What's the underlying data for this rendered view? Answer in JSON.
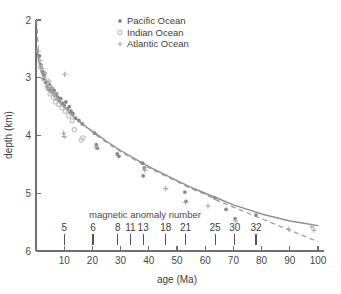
{
  "chart_data": {
    "type": "scatter",
    "title": "",
    "xlabel": "age (Ma)",
    "ylabel": "depth (km)",
    "inner_annotation": "magnetic anomaly number",
    "xlim": [
      0,
      100
    ],
    "ylim": [
      6,
      2
    ],
    "y_inverted": true,
    "grid": false,
    "legend_position": "top-center",
    "x_ticks": [
      10,
      20,
      30,
      40,
      50,
      60,
      70,
      80,
      90,
      100
    ],
    "x_tick_labels": [
      "10",
      "20",
      "30",
      "40",
      "50",
      "60",
      "70",
      "80",
      "90",
      "100"
    ],
    "y_ticks": [
      2,
      3,
      4,
      5,
      6
    ],
    "y_tick_labels": [
      "2",
      "3",
      "4",
      "5",
      "6"
    ],
    "magnetic_anomalies": [
      {
        "label": "5",
        "age": 10.0
      },
      {
        "label": "6",
        "age": 20.2
      },
      {
        "label": "8",
        "age": 29.0
      },
      {
        "label": "11",
        "age": 33.5
      },
      {
        "label": "13",
        "age": 38.0
      },
      {
        "label": "18",
        "age": 46.0
      },
      {
        "label": "21",
        "age": 53.0
      },
      {
        "label": "25",
        "age": 63.5
      },
      {
        "label": "30",
        "age": 70.5
      },
      {
        "label": "32",
        "age": 78.0
      }
    ],
    "series": [
      {
        "name": "Pacific Ocean",
        "marker": "filled-circle",
        "color": "#8a8a8a",
        "points": [
          [
            1.2,
            2.62
          ],
          [
            1.8,
            2.78
          ],
          [
            2.4,
            2.9
          ],
          [
            2.6,
            3.02
          ],
          [
            3.0,
            2.96
          ],
          [
            3.4,
            3.08
          ],
          [
            3.9,
            3.14
          ],
          [
            4.3,
            3.2
          ],
          [
            4.8,
            3.12
          ],
          [
            5.2,
            3.24
          ],
          [
            5.6,
            3.18
          ],
          [
            6.0,
            3.26
          ],
          [
            6.4,
            3.22
          ],
          [
            6.9,
            3.3
          ],
          [
            7.3,
            3.28
          ],
          [
            7.8,
            3.34
          ],
          [
            8.2,
            3.4
          ],
          [
            8.8,
            3.36
          ],
          [
            9.4,
            3.44
          ],
          [
            10.0,
            3.48
          ],
          [
            10.6,
            3.42
          ],
          [
            11.2,
            3.54
          ],
          [
            11.8,
            3.5
          ],
          [
            12.4,
            3.58
          ],
          [
            13.1,
            3.62
          ],
          [
            14.0,
            3.7
          ],
          [
            15.2,
            3.74
          ],
          [
            16.4,
            3.8
          ],
          [
            20.8,
            3.96
          ],
          [
            21.4,
            4.16
          ],
          [
            21.8,
            4.22
          ],
          [
            28.8,
            4.32
          ],
          [
            29.4,
            4.36
          ],
          [
            37.8,
            4.48
          ],
          [
            38.4,
            4.56
          ],
          [
            38.0,
            4.7
          ],
          [
            52.8,
            4.98
          ],
          [
            53.2,
            5.14
          ],
          [
            63.4,
            5.08
          ],
          [
            67.4,
            5.28
          ],
          [
            70.6,
            5.44
          ],
          [
            78.0,
            5.38
          ]
        ]
      },
      {
        "name": "Indian Ocean",
        "marker": "open-circle",
        "color": "#c0c0c0",
        "points": [
          [
            1.6,
            2.82
          ],
          [
            2.8,
            3.02
          ],
          [
            4.0,
            3.16
          ],
          [
            5.0,
            3.28
          ],
          [
            6.2,
            3.34
          ],
          [
            7.0,
            3.42
          ],
          [
            8.0,
            3.46
          ],
          [
            9.2,
            3.52
          ],
          [
            10.4,
            3.58
          ],
          [
            11.6,
            3.66
          ],
          [
            12.8,
            3.74
          ],
          [
            13.6,
            3.9
          ],
          [
            16.0,
            4.08
          ],
          [
            16.6,
            4.04
          ]
        ]
      },
      {
        "name": "Atlantic Ocean",
        "marker": "plus",
        "color": "#a8a8a8",
        "points": [
          [
            0.8,
            2.54
          ],
          [
            1.4,
            2.7
          ],
          [
            2.2,
            2.84
          ],
          [
            3.2,
            2.92
          ],
          [
            4.6,
            3.06
          ],
          [
            5.8,
            3.18
          ],
          [
            6.6,
            3.28
          ],
          [
            7.6,
            3.38
          ],
          [
            10.2,
            2.94
          ],
          [
            9.8,
            3.96
          ],
          [
            10.0,
            4.02
          ],
          [
            21.2,
            4.2
          ],
          [
            38.6,
            4.6
          ],
          [
            46.0,
            4.92
          ],
          [
            53.0,
            5.16
          ],
          [
            61.0,
            5.22
          ],
          [
            70.8,
            5.48
          ],
          [
            89.6,
            5.62
          ],
          [
            97.8,
            5.58
          ],
          [
            98.6,
            5.64
          ]
        ]
      }
    ],
    "curves": [
      {
        "name": "plate-model-curve",
        "style": "solid",
        "color": "#8f8f8f",
        "points": [
          [
            0.3,
            2.5
          ],
          [
            1.0,
            2.72
          ],
          [
            2.0,
            2.92
          ],
          [
            3.0,
            3.04
          ],
          [
            4.0,
            3.14
          ],
          [
            5.0,
            3.22
          ],
          [
            6.0,
            3.3
          ],
          [
            8.0,
            3.42
          ],
          [
            10.0,
            3.52
          ],
          [
            12.0,
            3.62
          ],
          [
            15.0,
            3.74
          ],
          [
            18.0,
            3.86
          ],
          [
            21.0,
            3.96
          ],
          [
            25.0,
            4.1
          ],
          [
            30.0,
            4.26
          ],
          [
            35.0,
            4.4
          ],
          [
            40.0,
            4.54
          ],
          [
            45.0,
            4.66
          ],
          [
            50.0,
            4.78
          ],
          [
            55.0,
            4.9
          ],
          [
            60.0,
            5.0
          ],
          [
            65.0,
            5.1
          ],
          [
            70.0,
            5.2
          ],
          [
            75.0,
            5.28
          ],
          [
            80.0,
            5.36
          ],
          [
            85.0,
            5.42
          ],
          [
            90.0,
            5.48
          ],
          [
            95.0,
            5.52
          ],
          [
            100.0,
            5.56
          ]
        ]
      },
      {
        "name": "sqrt-age-curve",
        "style": "dashed",
        "color": "#9a9a9a",
        "points": [
          [
            0.2,
            2.0
          ],
          [
            1.0,
            2.62
          ],
          [
            2.0,
            2.82
          ],
          [
            3.0,
            2.96
          ],
          [
            4.0,
            3.06
          ],
          [
            5.0,
            3.16
          ],
          [
            6.0,
            3.24
          ],
          [
            8.0,
            3.38
          ],
          [
            10.0,
            3.5
          ],
          [
            12.0,
            3.6
          ],
          [
            15.0,
            3.74
          ],
          [
            18.0,
            3.86
          ],
          [
            21.0,
            3.98
          ],
          [
            25.0,
            4.12
          ],
          [
            30.0,
            4.28
          ],
          [
            35.0,
            4.42
          ],
          [
            40.0,
            4.56
          ],
          [
            45.0,
            4.68
          ],
          [
            50.0,
            4.8
          ],
          [
            55.0,
            4.92
          ],
          [
            60.0,
            5.02
          ],
          [
            65.0,
            5.14
          ],
          [
            70.0,
            5.24
          ],
          [
            75.0,
            5.34
          ],
          [
            80.0,
            5.44
          ],
          [
            85.0,
            5.54
          ],
          [
            90.0,
            5.64
          ],
          [
            95.0,
            5.74
          ],
          [
            100.0,
            5.84
          ]
        ]
      }
    ],
    "legend": [
      {
        "label": "Pacific Ocean",
        "marker": "filled-circle"
      },
      {
        "label": "Indian Ocean",
        "marker": "open-circle"
      },
      {
        "label": "Atlantic Ocean",
        "marker": "plus"
      }
    ]
  }
}
